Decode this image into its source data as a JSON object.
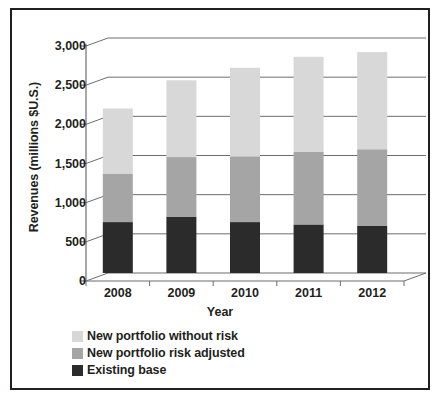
{
  "chart_data": {
    "type": "bar",
    "subtype": "stacked-column-3d",
    "title": "",
    "xlabel": "Year",
    "ylabel": "Revenues (millions $U.S.)",
    "categories": [
      "2008",
      "2009",
      "2010",
      "2011",
      "2012"
    ],
    "ylim": [
      0,
      3000
    ],
    "yticks": [
      0,
      500,
      1000,
      1500,
      2000,
      2500,
      3000
    ],
    "ytick_labels": [
      "0",
      "500",
      "1,000",
      "1,500",
      "2,000",
      "2,500",
      "3,000"
    ],
    "grid": true,
    "grid_axis": "y",
    "legend_position": "below-axis-left",
    "stack_order_bottom_to_top": [
      "Existing base",
      "New portfolio risk adjusted",
      "New portfolio without risk"
    ],
    "series": [
      {
        "name": "Existing base",
        "color": "#2b2b2b",
        "values": [
          650,
          720,
          650,
          620,
          600
        ]
      },
      {
        "name": "New portfolio risk adjusted",
        "color": "#a5a5a5",
        "values": [
          620,
          760,
          840,
          930,
          980
        ]
      },
      {
        "name": "New portfolio without risk",
        "color": "#d8d8d8",
        "values": [
          830,
          980,
          1130,
          1210,
          1240
        ]
      }
    ],
    "totals": [
      2100,
      2460,
      2620,
      2760,
      2820
    ]
  },
  "legend": {
    "items": [
      {
        "label": "New portfolio without risk",
        "color": "#d8d8d8"
      },
      {
        "label": "New portfolio risk adjusted",
        "color": "#a5a5a5"
      },
      {
        "label": "Existing base",
        "color": "#2b2b2b"
      }
    ]
  },
  "colors": {
    "ink": "#231f20",
    "gridline": "#6d6d6d",
    "axis": "#6d6d6d",
    "background": "#ffffff",
    "frame": "#231f20"
  }
}
